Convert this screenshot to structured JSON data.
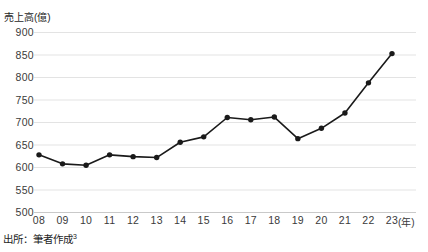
{
  "chart_data": {
    "type": "line",
    "title": "",
    "xlabel": "(年)",
    "ylabel": "売上高(億)",
    "ylim": [
      500,
      900
    ],
    "ytick_step": 50,
    "yticks": [
      "900",
      "850",
      "800",
      "750",
      "700",
      "650",
      "600",
      "550",
      "500"
    ],
    "categories": [
      "08",
      "09",
      "10",
      "11",
      "12",
      "13",
      "14",
      "15",
      "16",
      "17",
      "18",
      "19",
      "20",
      "21",
      "22",
      "23"
    ],
    "values": [
      627,
      607,
      604,
      627,
      623,
      621,
      655,
      667,
      710,
      705,
      711,
      663,
      686,
      720,
      787,
      852
    ],
    "series": [
      {
        "name": "売上高",
        "values": [
          627,
          607,
          604,
          627,
          623,
          621,
          655,
          667,
          710,
          705,
          711,
          663,
          686,
          720,
          787,
          852
        ]
      }
    ],
    "grid": true,
    "legend": "none",
    "marker": "circle",
    "line_color": "#1a1a1a",
    "marker_color": "#1a1a1a",
    "grid_color": "#e3e3e3"
  },
  "axis": {
    "y_title": "売上高(億)",
    "x_unit": "(年)"
  },
  "legend_clipped": {
    "item1": "",
    "item2": ""
  },
  "footer": {
    "source_prefix": "出所：筆者作成",
    "source_note": "3"
  }
}
